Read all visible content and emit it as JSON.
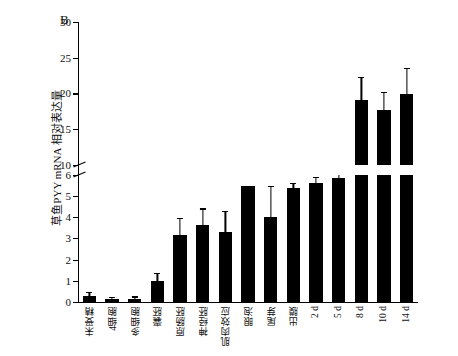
{
  "chart_data": {
    "type": "bar",
    "title": "B",
    "xlabel": "",
    "ylabel": "草鱼PYY mRNA 相对表达量",
    "ylim": [
      0,
      30
    ],
    "yticks": [
      0,
      1,
      2,
      3,
      4,
      5,
      6,
      10,
      15,
      20,
      25,
      30
    ],
    "axis_break": {
      "low": 6,
      "high": 10
    },
    "grid": false,
    "legend": "none",
    "categories": [
      "未受精",
      "4细胞",
      "多细胞",
      "囊胚",
      "原肠胚",
      "神经胚",
      "肌肉效应",
      "眼泡",
      "尾芽",
      "出膜",
      "2 d",
      "5 d",
      "8 d",
      "10 d",
      "14 d"
    ],
    "values": [
      0.3,
      0.12,
      0.15,
      1.0,
      3.15,
      3.65,
      3.3,
      5.45,
      4.0,
      6.8,
      7.5,
      8.1,
      19.1,
      17.7,
      19.9
    ],
    "errors": [
      0.12,
      0.06,
      0.06,
      0.3,
      0.75,
      0.7,
      0.95,
      0.6,
      1.4,
      0.45,
      0.6,
      0.85,
      3.1,
      2.4,
      3.5
    ]
  },
  "panel": {
    "label": "B"
  }
}
